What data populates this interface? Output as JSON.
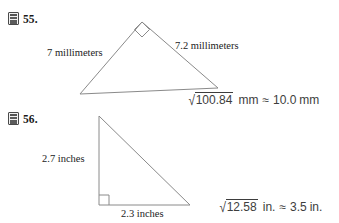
{
  "problems": [
    {
      "number": "55.",
      "icon": "calculator-icon",
      "labels": {
        "side_a": "7 millimeters",
        "side_b": "7.2 millimeters"
      },
      "answer": {
        "radicand": "100.84",
        "radicand_unit": "mm",
        "relation": "≈",
        "result": "10.0",
        "result_unit": "mm"
      },
      "figure": {
        "type": "right-triangle",
        "right_angle_vertex": "apex",
        "vertices": [
          [
            80,
            94
          ],
          [
            142,
            22
          ],
          [
            218,
            88
          ]
        ]
      }
    },
    {
      "number": "56.",
      "icon": "calculator-icon",
      "labels": {
        "side_a": "2.7 inches",
        "side_b": "2.3 inches"
      },
      "answer": {
        "radicand": "12.58",
        "radicand_unit": "in.",
        "relation": "≈",
        "result": "3.5",
        "result_unit": "in."
      },
      "figure": {
        "type": "right-triangle",
        "right_angle_vertex": "bottom-left",
        "vertices": [
          [
            99,
            116
          ],
          [
            99,
            205
          ],
          [
            190,
            205
          ]
        ]
      }
    }
  ],
  "colors": {
    "ink": "#1a1a1a",
    "figure_stroke": "#8a8a8a",
    "answer_ink": "#3d3d3d"
  }
}
